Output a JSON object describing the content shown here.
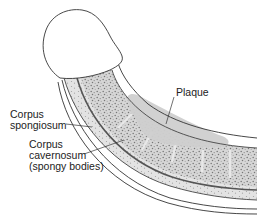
{
  "labels": {
    "plaque": "Plaque",
    "corpus_spongiosum_line1": "Corpus",
    "corpus_spongiosum_line2": "spongiosum",
    "corpus_cavernosum_line1": "Corpus",
    "corpus_cavernosum_line2": "cavernosum",
    "corpus_cavernosum_line3": "(spongy bodies)"
  },
  "colors": {
    "outline": "#333333",
    "tissue_fill": "#d9d9d9",
    "speckle": "#8a8a8a",
    "plaque_fill": "#cfcfcf",
    "background": "#ffffff"
  }
}
